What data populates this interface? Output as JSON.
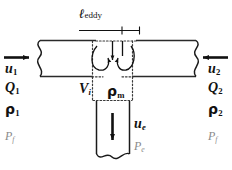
{
  "figure": {
    "type": "schematic-diagram",
    "background_color": "#ffffff",
    "line_color": "#1a1a1a",
    "dotted_color": "#3a3a3a",
    "faint_text_color": "#8a8a8a",
    "width": 232,
    "height": 170
  },
  "labels": {
    "eddy_length": {
      "symbol": "ℓ",
      "subscript": "eddy"
    },
    "left_inlet": {
      "velocity": {
        "symbol": "u",
        "subscript": "1"
      },
      "flow_rate": {
        "symbol": "Q",
        "subscript": "1"
      },
      "density": {
        "symbol": "ρ",
        "subscript": "1"
      },
      "pressure": {
        "symbol": "P",
        "subscript": "f"
      }
    },
    "right_inlet": {
      "velocity": {
        "symbol": "u",
        "subscript": "2"
      },
      "flow_rate": {
        "symbol": "Q",
        "subscript": "2"
      },
      "density": {
        "symbol": "ρ",
        "subscript": "2"
      },
      "pressure": {
        "symbol": "P",
        "subscript": "f"
      }
    },
    "junction": {
      "volume": {
        "symbol": "V",
        "subscript": "i"
      },
      "mix_density": {
        "symbol": "ρ",
        "subscript": "m"
      }
    },
    "outlet": {
      "velocity": {
        "symbol": "u",
        "subscript": "e"
      },
      "pressure": {
        "symbol": "P",
        "subscript": "e"
      }
    }
  },
  "arrows": {
    "left_inflow_direction": "right",
    "right_inflow_direction": "left",
    "outflow_direction": "down",
    "eddy_rotation": "two counter-rotating vortices",
    "dimension_line": "eddy length extent"
  }
}
